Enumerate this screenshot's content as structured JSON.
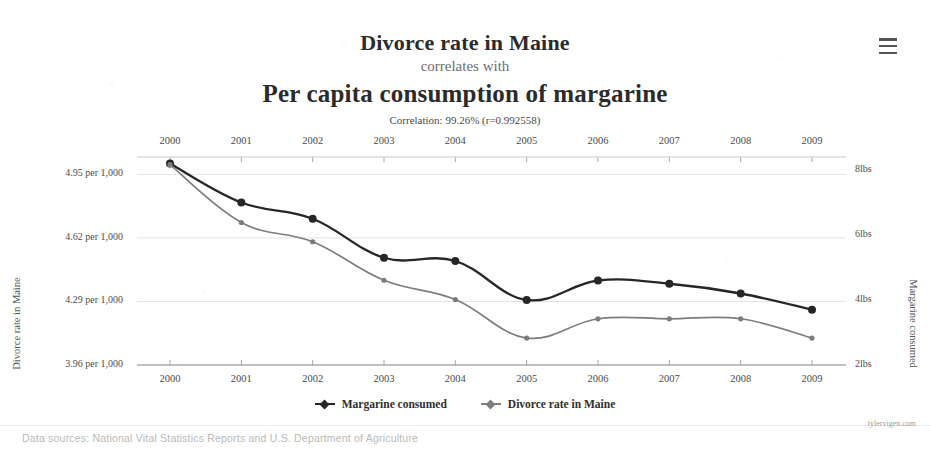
{
  "header": {
    "title_top": "Divorce rate in Maine",
    "connector": "correlates with",
    "title_bottom": "Per capita consumption of margarine",
    "correlation": "Correlation: 99.26% (r=0.992558)",
    "menu_icon": "hamburger-menu-icon"
  },
  "legend": {
    "items": [
      {
        "label": "Margarine consumed",
        "color": "#262626"
      },
      {
        "label": "Divorce rate in Maine",
        "color": "#7d7d7d"
      }
    ]
  },
  "footer": {
    "sources": "Data sources: National Vital Statistics Reports and U.S. Department of Agriculture",
    "attribution": "tylervigen.com"
  },
  "axes": {
    "left_title": "Divorce rate in Maine",
    "right_title": "Margarine consumed",
    "left_ticks": [
      "4.95 per 1,000",
      "4.62 per 1,000",
      "4.29 per 1,000",
      "3.96 per 1,000"
    ],
    "right_ticks": [
      "8lbs",
      "6lbs",
      "4lbs",
      "2lbs"
    ],
    "x_ticks_top": [
      "2000",
      "2001",
      "2002",
      "2003",
      "2004",
      "2005",
      "2006",
      "2007",
      "2008",
      "2009"
    ],
    "x_ticks_bottom": [
      "2000",
      "2001",
      "2002",
      "2003",
      "2004",
      "2005",
      "2006",
      "2007",
      "2008",
      "2009"
    ]
  },
  "chart_data": {
    "type": "line",
    "title": "Divorce rate in Maine correlates with Per capita consumption of margarine",
    "subtitle": "Correlation: 99.26% (r=0.992558)",
    "xlabel": "",
    "ylabel": "Divorce rate in Maine",
    "y2label": "Margarine consumed",
    "x": [
      2000,
      2001,
      2002,
      2003,
      2004,
      2005,
      2006,
      2007,
      2008,
      2009
    ],
    "grid": true,
    "legend_position": "bottom-center",
    "ylim": [
      3.96,
      5.04
    ],
    "ytick_values": [
      4.95,
      4.62,
      4.29,
      3.96
    ],
    "y2lim": [
      2.0,
      8.4
    ],
    "y2tick_values": [
      8,
      6,
      4,
      2
    ],
    "series": [
      {
        "name": "Margarine consumed",
        "axis": "right",
        "unit": "lbs",
        "color": "#262626",
        "values": [
          8.2,
          7.0,
          6.5,
          5.3,
          5.2,
          4.0,
          4.6,
          4.5,
          4.2,
          3.7
        ]
      },
      {
        "name": "Divorce rate in Maine",
        "axis": "left",
        "unit": "per 1,000",
        "color": "#7d7d7d",
        "values": [
          5.0,
          4.7,
          4.6,
          4.4,
          4.3,
          4.1,
          4.2,
          4.2,
          4.2,
          4.1
        ]
      }
    ]
  }
}
